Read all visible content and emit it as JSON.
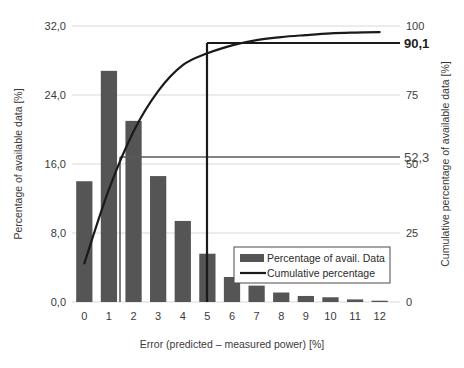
{
  "chart_data": {
    "type": "bar",
    "title": "",
    "xlabel": "Error (predicted – measured power) [%]",
    "ylabel": "Percentage of available data [%]",
    "y2label": "Cumulative percentage of available data [%]",
    "categories": [
      "0",
      "1",
      "2",
      "3",
      "4",
      "5",
      "6",
      "7",
      "8",
      "9",
      "10",
      "11",
      "12"
    ],
    "ylim": [
      0,
      32
    ],
    "y2lim": [
      0,
      100
    ],
    "yticks": [
      "0,0",
      "8,0",
      "16,0",
      "24,0",
      "32,0"
    ],
    "ytick_values": [
      0,
      8,
      16,
      24,
      32
    ],
    "y2ticks": [
      "0",
      "25",
      "50",
      "75",
      "100"
    ],
    "y2tick_values": [
      0,
      25,
      50,
      75,
      100
    ],
    "grid": true,
    "legend_position": "bottom-right",
    "series": [
      {
        "name": "Percentage of avail. Data",
        "type": "bar",
        "axis": "left",
        "color": "#555555",
        "values": [
          14.0,
          26.8,
          21.0,
          14.6,
          9.4,
          5.6,
          2.9,
          1.9,
          1.1,
          0.7,
          0.55,
          0.3,
          0.15
        ]
      },
      {
        "name": "Cumulative percentage",
        "type": "line",
        "axis": "right",
        "color": "#1a1a1a",
        "values": [
          14.0,
          40.8,
          61.8,
          76.4,
          85.8,
          90.1,
          93.0,
          94.9,
          96.0,
          96.7,
          97.3,
          97.6,
          97.8
        ]
      }
    ],
    "annotations": [
      {
        "name": "cumulative-at-error-5",
        "label": "90,1",
        "value": 90.1,
        "axis": "right",
        "x_category": "5",
        "style": "bold"
      },
      {
        "name": "cumulative-at-error-2",
        "label": "52,3",
        "value": 52.3,
        "axis": "right",
        "x_category": "2",
        "style": "light"
      }
    ]
  },
  "legend": {
    "items": [
      {
        "label": "Percentage of avail. Data",
        "marker": "bar-swatch"
      },
      {
        "label": "Cumulative percentage",
        "marker": "line-swatch"
      }
    ]
  },
  "colors": {
    "bar": "#555555",
    "curve": "#1a1a1a",
    "grid": "#d9d9d9",
    "text": "#2b2b2b",
    "background": "#ffffff"
  }
}
